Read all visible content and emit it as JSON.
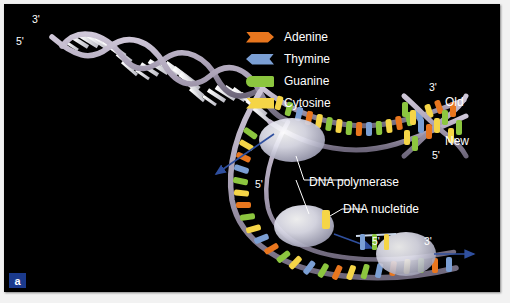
{
  "figure": {
    "panel_letter": "a",
    "background_color": "#000000",
    "border_color": "#ffffff"
  },
  "legend": {
    "items": [
      {
        "label": "Adenine",
        "color": "#e8761e",
        "shape": "notch-left-arrow-right"
      },
      {
        "label": "Thymine",
        "color": "#7b9fd4",
        "shape": "point-left-notch-right"
      },
      {
        "label": "Guanine",
        "color": "#8cc63f",
        "shape": "round-left-flat-right"
      },
      {
        "label": "Cytosine",
        "color": "#f5d547",
        "shape": "notch-left-flat-right"
      }
    ]
  },
  "annotations": {
    "parent_3prime": "3'",
    "parent_5prime": "5'",
    "leading_3prime": "3'",
    "leading_label_old": "Old",
    "leading_label_new": "New",
    "leading_5prime": "5'",
    "fork_5prime": "5'",
    "polymerase_label": "DNA polymerase",
    "nucleotide_label": "DNA nucletide",
    "lagging_5prime": "5'",
    "lagging_3prime": "3'"
  },
  "colors": {
    "adenine": "#e8761e",
    "thymine": "#7b9fd4",
    "guanine": "#8cc63f",
    "cytosine": "#f5d547",
    "backbone": "#a89fb4",
    "helix_rung": "#f2f2f2",
    "arrow": "#2f4f9e",
    "leader_line": "#ffffff",
    "enzyme": "#d8d8e6"
  }
}
